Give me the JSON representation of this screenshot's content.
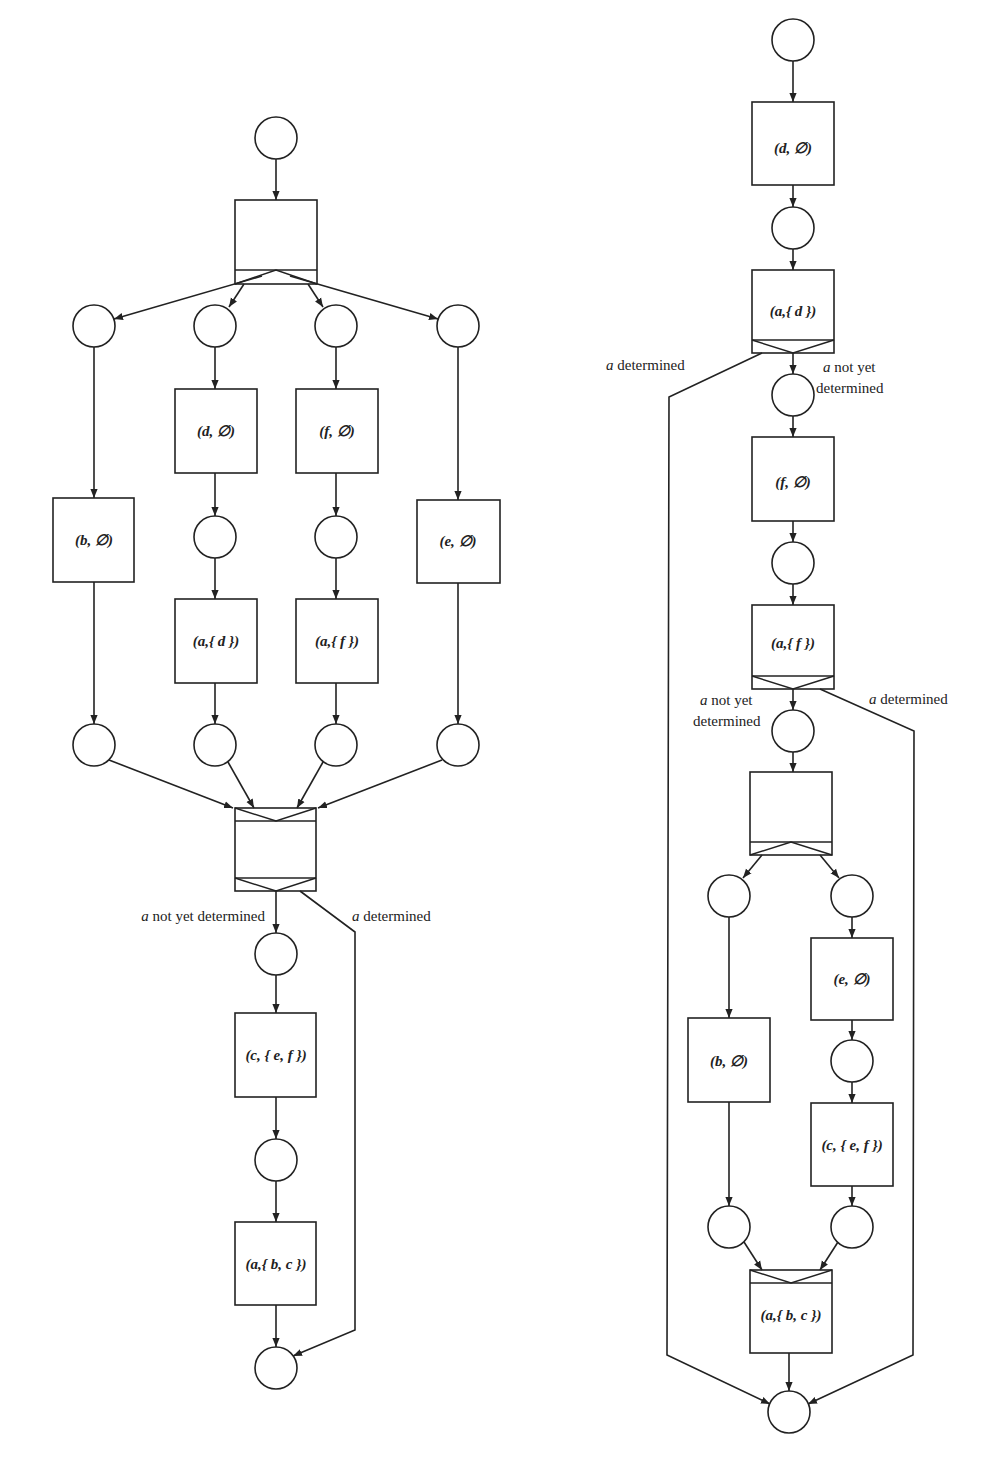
{
  "left_net": {
    "transitions": {
      "t_split": "",
      "t_d": "(d, ∅)",
      "t_f": "(f, ∅)",
      "t_b": "(b, ∅)",
      "t_e": "(e, ∅)",
      "t_ad": "(a,{ d })",
      "t_af": "(a,{ f })",
      "t_join": "",
      "t_c": "(c, { e, f })",
      "t_abc": "(a,{ b, c })"
    },
    "labels": {
      "not_determined_var": "a",
      "not_determined_text": " not yet determined",
      "determined_var": "a",
      "determined_text": " determined"
    }
  },
  "right_net": {
    "transitions": {
      "t_d": "(d, ∅)",
      "t_ad": "(a,{ d })",
      "t_f": "(f, ∅)",
      "t_af": "(a,{ f })",
      "t_split": "",
      "t_e": "(e, ∅)",
      "t_c": "(c, { e, f })",
      "t_b": "(b, ∅)",
      "t_abc": "(a,{ b, c })"
    },
    "labels": {
      "ad_determined_var": "a",
      "ad_determined_text": " determined",
      "ad_not_var": "a",
      "ad_not_line1": " not yet",
      "ad_not_line2": "determined",
      "af_not_var": "a",
      "af_not_line1": " not yet",
      "af_not_line2": "determined",
      "af_determined_var": "a",
      "af_determined_text": " determined"
    }
  },
  "colors": {
    "stroke": "#222222",
    "background": "#ffffff"
  }
}
